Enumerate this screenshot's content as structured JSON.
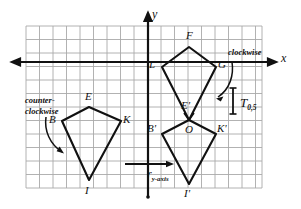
{
  "figure": {
    "type": "geometry-diagram",
    "grid": {
      "x_left": 26,
      "y_top": 26,
      "x_right": 262,
      "y_bottom": 188,
      "cell": 13.5,
      "grid_color": "#a8a8a8",
      "grid_on": true
    },
    "axes": {
      "origin_x": 148,
      "origin_y": 62,
      "x_label": "x",
      "y_label": "y",
      "axis_color": "#111111"
    },
    "shapes": [
      {
        "name": "kite-BEKI",
        "stroke": "#111111",
        "vertices": [
          {
            "label": "B",
            "x": 62,
            "y": 121
          },
          {
            "label": "E",
            "x": 89,
            "y": 107
          },
          {
            "label": "K",
            "x": 121,
            "y": 121
          },
          {
            "label": "I",
            "x": 89,
            "y": 180
          }
        ]
      },
      {
        "name": "kite-LFGE-prime",
        "stroke": "#111111",
        "vertices": [
          {
            "label": "L",
            "x": 162,
            "y": 67
          },
          {
            "label": "F",
            "x": 189,
            "y": 47
          },
          {
            "label": "G",
            "x": 216,
            "y": 67
          },
          {
            "label": "E'",
            "x": 189,
            "y": 120
          }
        ]
      },
      {
        "name": "kite-B-prime-O-K-prime-I-prime",
        "stroke": "#111111",
        "vertices": [
          {
            "label": "B'",
            "x": 162,
            "y": 134
          },
          {
            "label": "O",
            "x": 189,
            "y": 120
          },
          {
            "label": "K'",
            "x": 216,
            "y": 134
          },
          {
            "label": "I'",
            "x": 189,
            "y": 184
          }
        ]
      }
    ],
    "vertex_labels": [
      {
        "text": "B",
        "x": 49,
        "y": 114
      },
      {
        "text": "E",
        "x": 85,
        "y": 92
      },
      {
        "text": "K",
        "x": 124,
        "y": 114
      },
      {
        "text": "I",
        "x": 85,
        "y": 186
      },
      {
        "text": "L",
        "x": 150,
        "y": 60
      },
      {
        "text": "F",
        "x": 186,
        "y": 31
      },
      {
        "text": "G",
        "x": 219,
        "y": 60
      },
      {
        "text": "E'",
        "x": 182,
        "y": 104
      },
      {
        "text": "B'",
        "x": 149,
        "y": 126
      },
      {
        "text": "O",
        "x": 186,
        "y": 126
      },
      {
        "text": "K'",
        "x": 219,
        "y": 126
      },
      {
        "text": "I'",
        "x": 185,
        "y": 189
      }
    ],
    "annotations": {
      "counter_clockwise_line1": "counter-",
      "counter_clockwise_line2": "clockwise",
      "clockwise": "clockwise",
      "transform_T": "T",
      "transform_T_subscript": "0,5",
      "reflection_r": "r",
      "reflection_r_subscript": "y-axis"
    },
    "segment_T": {
      "x": 233,
      "y_top": 88,
      "y_bottom": 114,
      "color": "#111111"
    },
    "arrow_r": {
      "x_start": 125,
      "x_end": 173,
      "y": 164,
      "color": "#111111"
    }
  }
}
